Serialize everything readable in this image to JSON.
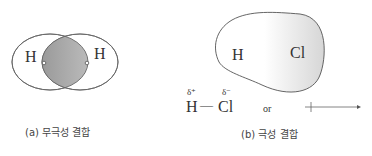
{
  "panel_a": {
    "atom_left": "H",
    "atom_right": "H",
    "caption": "(a) 무극성 결합"
  },
  "panel_b": {
    "atom_h": "H",
    "atom_cl": "Cl",
    "delta_plus": "δ⁺",
    "delta_minus": "δ⁻",
    "formula_h": "H",
    "bond": "—",
    "formula_cl": "Cl",
    "or_label": "or",
    "caption": "(b) 극성 결합"
  }
}
